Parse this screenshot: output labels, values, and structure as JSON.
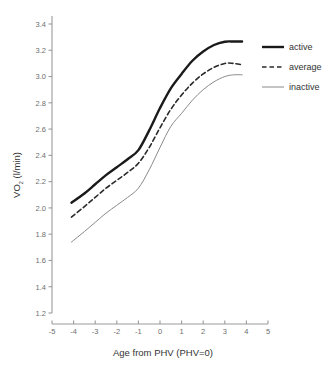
{
  "chart_data": {
    "type": "line",
    "title": "",
    "subtitle": "",
    "xlabel": "Age from PHV (PHV=0)",
    "ylabel": "VO2 (l/min)",
    "ylabel_main": "VO",
    "ylabel_sub": "2",
    "ylabel_units": " (l/min)",
    "xlim": [
      -5,
      5
    ],
    "ylim": [
      1.2,
      3.4
    ],
    "xticks": [
      -5,
      -4,
      -3,
      -2,
      -1,
      0,
      1,
      2,
      3,
      4,
      5
    ],
    "xtick_labels": [
      "-5",
      "-4",
      "-3",
      "-2",
      "-1",
      "0",
      "1",
      "2",
      "3",
      "4",
      "5"
    ],
    "yticks": [
      1.2,
      1.4,
      1.6,
      1.8,
      2.0,
      2.2,
      2.4,
      2.6,
      2.8,
      3.0,
      3.2,
      3.4
    ],
    "ytick_labels": [
      "1.2",
      "1.4",
      "1.6",
      "1.8",
      "2.0",
      "2.2",
      "2.4",
      "2.6",
      "2.8",
      "3.0",
      "3.2",
      "3.4"
    ],
    "grid": false,
    "legend_position": "top-right",
    "x": [
      -4.1,
      -3.5,
      -3.0,
      -2.5,
      -2.0,
      -1.5,
      -1.0,
      -0.5,
      0.0,
      0.5,
      1.0,
      1.5,
      2.0,
      2.5,
      3.0,
      3.4,
      3.8
    ],
    "series": [
      {
        "name": "active",
        "style": "solid",
        "width": 2.4,
        "color": "#1a1a1a",
        "values": [
          2.04,
          2.11,
          2.18,
          2.25,
          2.31,
          2.37,
          2.44,
          2.59,
          2.76,
          2.91,
          3.02,
          3.12,
          3.19,
          3.24,
          3.265,
          3.267,
          3.267
        ]
      },
      {
        "name": "average",
        "style": "dashed",
        "width": 1.6,
        "color": "#2a2a2a",
        "values": [
          1.93,
          2.01,
          2.08,
          2.15,
          2.21,
          2.27,
          2.34,
          2.46,
          2.61,
          2.75,
          2.86,
          2.95,
          3.02,
          3.07,
          3.1,
          3.1,
          3.09
        ]
      },
      {
        "name": "inactive",
        "style": "solid",
        "width": 1.0,
        "color": "#8a8a8a",
        "values": [
          1.74,
          1.82,
          1.89,
          1.96,
          2.02,
          2.08,
          2.15,
          2.29,
          2.46,
          2.62,
          2.72,
          2.82,
          2.9,
          2.96,
          3.0,
          3.013,
          3.013
        ]
      }
    ]
  },
  "legend": {
    "items": [
      {
        "label": "active"
      },
      {
        "label": "average"
      },
      {
        "label": "inactive"
      }
    ]
  },
  "axes": {
    "x_title": "Age from PHV (PHV=0)",
    "y_title_main": "VO",
    "y_title_sub": "2",
    "y_title_rest": " (l/min)"
  },
  "colors": {
    "axis": "#9b9b9b",
    "tick_text": "#6e6e6e",
    "title_text": "#333333",
    "active": "#1a1a1a",
    "average": "#2a2a2a",
    "inactive": "#8a8a8a",
    "background": "#ffffff"
  }
}
